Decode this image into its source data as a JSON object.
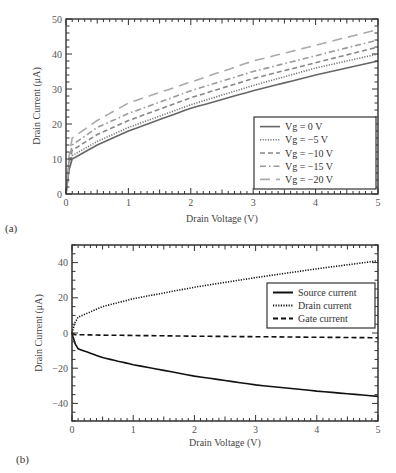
{
  "chart_data": [
    {
      "panel": "(a)",
      "type": "line",
      "title": "",
      "xlabel": "Drain Voltage (V)",
      "ylabel": "Drain Current (μA)",
      "xlim": [
        0,
        5
      ],
      "ylim": [
        0,
        50
      ],
      "xticks": [
        "0",
        "1",
        "2",
        "3",
        "4",
        "5"
      ],
      "yticks": [
        "0",
        "10",
        "20",
        "30",
        "40",
        "50"
      ],
      "grid": false,
      "legend_position": "lower right",
      "x": [
        0,
        0.05,
        0.1,
        0.5,
        1,
        2,
        3,
        4,
        5
      ],
      "series": [
        {
          "name": "Vg = 0 V",
          "style": "solid",
          "color": "#666666",
          "values": [
            0,
            7,
            10,
            14,
            18,
            24.5,
            29.5,
            34,
            38
          ]
        },
        {
          "name": "Vg = −5 V",
          "style": "dotted",
          "color": "#777777",
          "values": [
            0,
            8,
            11,
            15,
            19,
            25.5,
            31,
            36,
            40
          ]
        },
        {
          "name": "Vg = −10 V",
          "style": "dashed",
          "color": "#888888",
          "values": [
            0,
            9,
            12.5,
            17,
            21,
            27.5,
            33,
            37.5,
            42
          ]
        },
        {
          "name": "Vg = −15 V",
          "style": "dashdot",
          "color": "#999999",
          "values": [
            0,
            10,
            14,
            19,
            23,
            29.5,
            35,
            39.5,
            44
          ]
        },
        {
          "name": "Vg = −20 V",
          "style": "longdash",
          "color": "#aaaaaa",
          "values": [
            0,
            11,
            16,
            21,
            26,
            32,
            38,
            42.5,
            47
          ]
        }
      ]
    },
    {
      "panel": "(b)",
      "type": "line",
      "title": "",
      "xlabel": "Drain Voltage (V)",
      "ylabel": "Drain Current (μA)",
      "xlim": [
        0,
        5
      ],
      "ylim": [
        -50,
        50
      ],
      "xticks": [
        "0",
        "1",
        "2",
        "3",
        "4",
        "5"
      ],
      "yticks": [
        "−40",
        "−20",
        "0",
        "20",
        "40"
      ],
      "grid": false,
      "legend_position": "upper right",
      "x": [
        0,
        0.05,
        0.1,
        0.5,
        1,
        2,
        3,
        4,
        5
      ],
      "series": [
        {
          "name": "Source current",
          "style": "solid",
          "color": "#111111",
          "values": [
            0,
            -6,
            -9,
            -14,
            -18,
            -24.5,
            -29.5,
            -33,
            -36
          ]
        },
        {
          "name": "Drain current",
          "style": "dotted",
          "color": "#111111",
          "values": [
            0,
            6,
            9,
            15,
            19.5,
            26,
            31.5,
            36.5,
            41
          ]
        },
        {
          "name": "Gate current",
          "style": "dashed",
          "color": "#111111",
          "values": [
            0,
            -1,
            -1,
            -1.2,
            -1.4,
            -1.8,
            -2.1,
            -2.4,
            -2.7
          ]
        }
      ]
    }
  ]
}
